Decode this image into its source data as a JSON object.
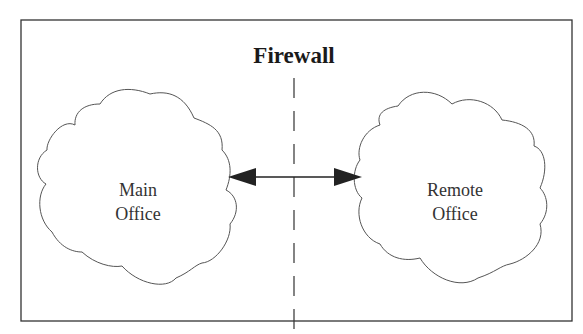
{
  "diagram": {
    "title": "Firewall",
    "nodes": [
      {
        "id": "main",
        "line1": "Main",
        "line2": "Office",
        "shape": "cloud"
      },
      {
        "id": "remote",
        "line1": "Remote",
        "line2": "Office",
        "shape": "cloud"
      }
    ],
    "edges": [
      {
        "from": "main",
        "to": "remote",
        "type": "bidirectional-arrow"
      }
    ],
    "divider": {
      "label": "Firewall",
      "style": "dashed-vertical"
    }
  }
}
